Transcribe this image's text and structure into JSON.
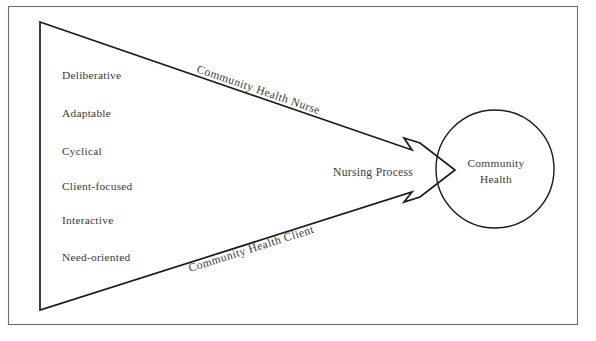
{
  "figure": {
    "background_color": "#ffffff",
    "frame_color": "#6e6e6e",
    "line_color": "#1a1a1a",
    "text_color": "#3a3a36"
  },
  "attributes": {
    "heading": "",
    "items": [
      {
        "label": "Deliberative"
      },
      {
        "label": "Adaptable"
      },
      {
        "label": "Cyclical"
      },
      {
        "label": "Client-focused"
      },
      {
        "label": "Interactive"
      },
      {
        "label": "Need-oriented"
      }
    ]
  },
  "edges": {
    "upper_label": "Community Health Nurse",
    "lower_label": "Community Health Client"
  },
  "arrow": {
    "label": "Nursing Process"
  },
  "outcome": {
    "line1": "Community",
    "line2": "Health"
  }
}
